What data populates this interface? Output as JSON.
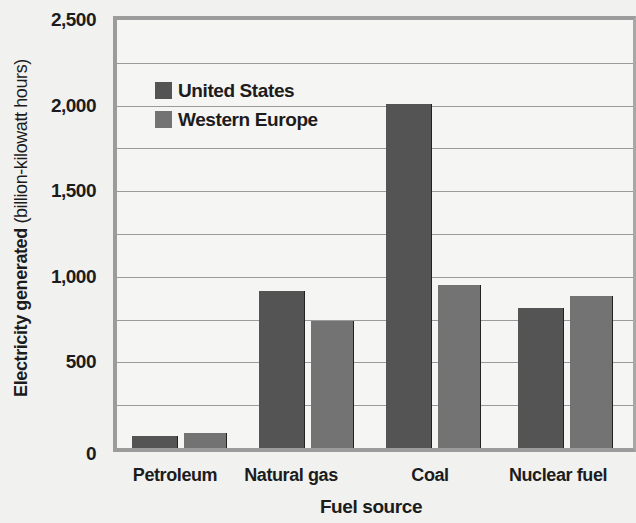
{
  "chart_data": {
    "type": "bar",
    "title": "",
    "xlabel": "Fuel source",
    "ylabel_bold": "Electricity generated",
    "ylabel_rest": " (billion-kilowatt hours)",
    "ylabel": "Electricity generated (billion-kilowatt hours)",
    "ylim": [
      0,
      2500
    ],
    "yticks": [
      0,
      500,
      1000,
      1500,
      2000,
      2500
    ],
    "ytick_labels": [
      "0",
      "500",
      "1,000",
      "1,500",
      "2,000",
      "2,500"
    ],
    "grid": true,
    "grid_step": 250,
    "legend_position": "upper-left inside plot",
    "categories": [
      "Petroleum",
      "Natural gas",
      "Coal",
      "Nuclear fuel"
    ],
    "series": [
      {
        "name": "United States",
        "color": "#545454",
        "values": [
          70,
          915,
          2010,
          820
        ]
      },
      {
        "name": "Western Europe",
        "color": "#737373",
        "values": [
          85,
          740,
          950,
          890
        ]
      }
    ]
  }
}
